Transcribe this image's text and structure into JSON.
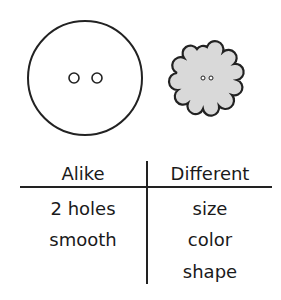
{
  "figure": {
    "buttons": [
      {
        "name": "large-round-button",
        "shape": "circle",
        "fill": "#ffffff",
        "holes": 2
      },
      {
        "name": "small-flower-button",
        "shape": "scalloped",
        "fill": "#d9d9d9",
        "holes": 2
      }
    ]
  },
  "tchart": {
    "headers": {
      "alike": "Alike",
      "different": "Different"
    },
    "alike": [
      "2 holes",
      "smooth"
    ],
    "different": [
      "size",
      "color",
      "shape"
    ]
  },
  "colors": {
    "stroke": "#222222",
    "flower_fill": "#d9d9d9"
  }
}
